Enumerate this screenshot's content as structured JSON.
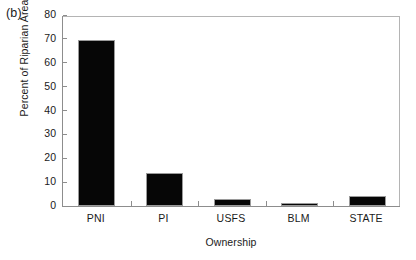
{
  "figure": {
    "panel_label": "(b)"
  },
  "chart_data": {
    "type": "bar",
    "title": "",
    "subtitle": "",
    "xlabel": "Ownership",
    "ylabel": "Percent of Riparian Area",
    "categories": [
      "PNI",
      "PI",
      "USFS",
      "BLM",
      "STATE"
    ],
    "values": [
      69.5,
      14.0,
      3.0,
      1.0,
      4.0
    ],
    "ylim": [
      0,
      80
    ],
    "yticks": [
      0,
      10,
      20,
      30,
      40,
      50,
      60,
      70,
      80
    ],
    "ytick_labels": [
      "0",
      "10",
      "20",
      "30",
      "40",
      "50",
      "60",
      "70",
      "80"
    ],
    "grid": false,
    "legend": null,
    "bar_color": "#060606",
    "bar_edge_color": "#9a9a9a",
    "axis_color": "#8d8d8d",
    "frame": "box",
    "annotations": [
      "(b)"
    ]
  }
}
